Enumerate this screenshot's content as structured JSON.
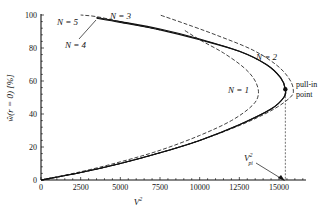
{
  "chart_data": {
    "type": "line",
    "title": "",
    "xlabel": "V²",
    "ylabel": "ŵ(r = 0) [%]",
    "xlim": [
      0,
      16700
    ],
    "ylim": [
      0,
      100
    ],
    "x_ticks": [
      0,
      2500,
      5000,
      7500,
      10000,
      12500,
      15000
    ],
    "x_tick_labels": [
      "0",
      "2500",
      "5000",
      "7500",
      "10000",
      "12500",
      "15000"
    ],
    "y_ticks": [
      0,
      20,
      40,
      60,
      80,
      100
    ],
    "y_tick_labels": [
      "0",
      "20",
      "40",
      "60",
      "80",
      "100"
    ],
    "grid": false,
    "series": [
      {
        "name": "N = 1",
        "style": "dashed",
        "points": [
          [
            0,
            0
          ],
          [
            2500,
            5
          ],
          [
            5000,
            11
          ],
          [
            7500,
            18
          ],
          [
            10000,
            27
          ],
          [
            12000,
            36
          ],
          [
            13300,
            45
          ],
          [
            13700,
            52
          ],
          [
            13500,
            60
          ],
          [
            12800,
            68
          ],
          [
            11500,
            77
          ],
          [
            10000,
            85
          ],
          [
            9000,
            91
          ]
        ]
      },
      {
        "name": "N = 2",
        "style": "dashed",
        "points": [
          [
            0,
            0
          ],
          [
            2500,
            4.5
          ],
          [
            5000,
            10
          ],
          [
            7500,
            16.5
          ],
          [
            10000,
            24
          ],
          [
            12500,
            33
          ],
          [
            14500,
            42
          ],
          [
            15700,
            50
          ],
          [
            15900,
            55
          ],
          [
            15600,
            62
          ],
          [
            14800,
            70
          ],
          [
            13300,
            79
          ],
          [
            11000,
            88
          ],
          [
            9000,
            95
          ],
          [
            7500,
            100
          ]
        ]
      },
      {
        "name": "N = 3",
        "style": "solid",
        "points": [
          [
            0,
            0
          ],
          [
            2500,
            4.5
          ],
          [
            5000,
            10
          ],
          [
            7500,
            16.5
          ],
          [
            10000,
            24
          ],
          [
            12500,
            33.5
          ],
          [
            14500,
            43
          ],
          [
            15300,
            50
          ],
          [
            15400,
            55
          ],
          [
            15100,
            62
          ],
          [
            14200,
            70
          ],
          [
            12500,
            78
          ],
          [
            10000,
            85
          ],
          [
            7500,
            91
          ],
          [
            5000,
            95.5
          ],
          [
            3500,
            98
          ]
        ]
      },
      {
        "name": "N = 4",
        "style": "solid",
        "points": [
          [
            0,
            0
          ],
          [
            2500,
            4.5
          ],
          [
            5000,
            10
          ],
          [
            7500,
            16.5
          ],
          [
            10000,
            24
          ],
          [
            12500,
            33.5
          ],
          [
            14500,
            43
          ],
          [
            15300,
            50
          ],
          [
            15400,
            55
          ],
          [
            15100,
            62
          ],
          [
            14200,
            70
          ],
          [
            12500,
            78
          ],
          [
            10000,
            85.5
          ],
          [
            7500,
            91.5
          ],
          [
            5000,
            96
          ],
          [
            3500,
            98.5
          ]
        ]
      },
      {
        "name": "N = 5",
        "style": "dashed",
        "points": [
          [
            7500,
            91
          ],
          [
            5000,
            96
          ],
          [
            3500,
            99
          ],
          [
            2500,
            100
          ]
        ]
      }
    ],
    "annotations": [
      {
        "text": "N = 1",
        "x": 12300,
        "y": 55
      },
      {
        "text": "N = 2",
        "x": 14200,
        "y": 66
      },
      {
        "text": "N = 3",
        "x": 4200,
        "y": 101
      },
      {
        "text": "N = 4",
        "x": 2000,
        "y": 91
      },
      {
        "text": "N = 5",
        "x": 800,
        "y": 98
      },
      {
        "text": "pull-in point",
        "x": 15400,
        "y": 55
      },
      {
        "text": "V²pi",
        "x": 15400,
        "y": 0
      }
    ],
    "pull_in_point": {
      "x": 15400,
      "y": 55
    }
  },
  "labels": {
    "xlabel": "V",
    "xlabel_sup": "2",
    "ylabel": "ŵ(r = 0) [%]",
    "n1": "N = 1",
    "n2": "N = 2",
    "n3": "N = 3",
    "n4": "N = 4",
    "n5": "N = 5",
    "pullin_1": "pull-in",
    "pullin_2": "point",
    "vpi": "V",
    "vpi_sup": "2",
    "vpi_sub": "pi"
  }
}
